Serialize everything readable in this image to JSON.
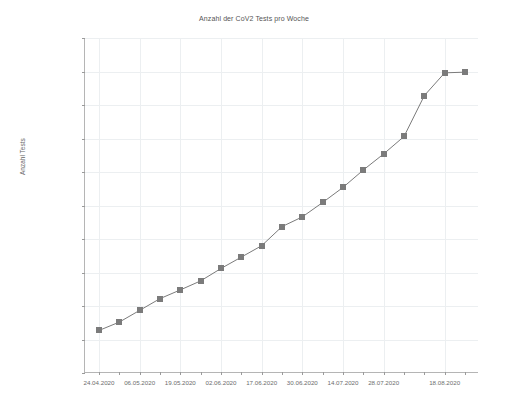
{
  "chart_data": {
    "type": "line",
    "title": "Anzahl der CoV2 Tests pro Woche",
    "xlabel": "",
    "ylabel": "Anzahl Tests",
    "ylim": [
      0,
      5000000
    ],
    "ytick_step": 500000,
    "grid": true,
    "legend": null,
    "marker": "square",
    "series_color": "#7b7b7b",
    "categories": [
      "24.04.2020",
      "30.04.2020",
      "06.05.2020",
      "12.05.2020",
      "19.05.2020",
      "26.05.2020",
      "02.06.2020",
      "09.06.2020",
      "17.06.2020",
      "23.06.2020",
      "30.06.2020",
      "07.07.2020",
      "14.07.2020",
      "21.07.2020",
      "28.07.2020",
      "04.08.2020",
      "11.08.2020",
      "18.08.2020",
      "25.08.2020"
    ],
    "values": [
      635000,
      760000,
      935000,
      1110000,
      1240000,
      1375000,
      1560000,
      1730000,
      1900000,
      2185000,
      2330000,
      2545000,
      2770000,
      3030000,
      3270000,
      3530000,
      4140000,
      4480000,
      4490000
    ],
    "ytick_labels": [
      "0",
      "500 000",
      "1 000 000",
      "1 500 000",
      "2 000 000",
      "2 500 000",
      "3 000 000",
      "3 500 000",
      "4 000 000",
      "4 500 000",
      "5 000 000"
    ],
    "ytick_values": [
      0,
      500000,
      1000000,
      1500000,
      2000000,
      2500000,
      3000000,
      3500000,
      4000000,
      4500000,
      5000000
    ],
    "xtick_labels": [
      "24.04.2020",
      "06.05.2020",
      "19.05.2020",
      "02.06.2020",
      "17.06.2020",
      "30.06.2020",
      "14.07.2020",
      "28.07.2020",
      "18.08.2020"
    ],
    "xtick_label_indices": [
      0,
      2,
      4,
      6,
      8,
      10,
      12,
      14,
      17
    ]
  }
}
